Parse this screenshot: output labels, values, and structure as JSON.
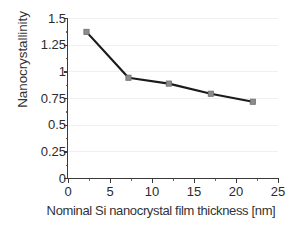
{
  "chart_data": {
    "type": "line",
    "title": "",
    "xlabel": "Nominal Si nanocrystal film thickness [nm]",
    "ylabel": "Nanocrystallinity",
    "xlim": [
      0,
      25
    ],
    "ylim": [
      0,
      1.5
    ],
    "grid": "horizontal",
    "legend": "none",
    "x": [
      2.2,
      7.2,
      12.0,
      17.0,
      22.0
    ],
    "values": [
      1.37,
      0.94,
      0.885,
      0.79,
      0.715
    ],
    "series": [
      {
        "name": "Nanocrystallinity vs thickness",
        "x": [
          2.2,
          7.2,
          12.0,
          17.0,
          22.0
        ],
        "values": [
          1.37,
          0.94,
          0.885,
          0.79,
          0.715
        ]
      }
    ],
    "xticks": [
      {
        "value": 0,
        "label": "0"
      },
      {
        "value": 5,
        "label": "5"
      },
      {
        "value": 10,
        "label": "10"
      },
      {
        "value": 15,
        "label": "15"
      },
      {
        "value": 20,
        "label": "20"
      },
      {
        "value": 25,
        "label": "25"
      }
    ],
    "xticks_minor": [
      2.5,
      7.5,
      12.5,
      17.5,
      22.5
    ],
    "yticks": [
      {
        "value": 0,
        "label": "0"
      },
      {
        "value": 0.25,
        "label": "0.25"
      },
      {
        "value": 0.5,
        "label": "0.5"
      },
      {
        "value": 0.75,
        "label": "0.75"
      },
      {
        "value": 1,
        "label": "1"
      },
      {
        "value": 1.25,
        "label": "1.25"
      },
      {
        "value": 1.5,
        "label": "1.5"
      }
    ],
    "yticks_minor": [
      0.125,
      0.375,
      0.625,
      0.875,
      1.125,
      1.375
    ],
    "colors": {
      "line": "#1a1a1a",
      "marker_fill": "#8c8c8c",
      "marker_edge": "#6e6e6e",
      "grid": "#f0f0f2",
      "axis": "#3a3a3a",
      "text": "#2b2b2b",
      "background": "#ffffff"
    }
  }
}
